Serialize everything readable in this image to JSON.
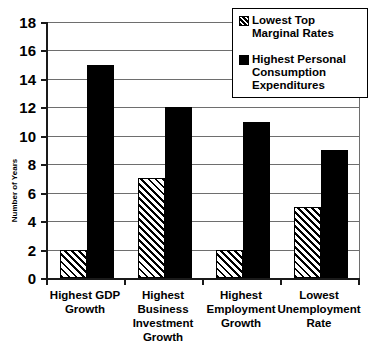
{
  "chart_data": {
    "type": "bar",
    "title": "",
    "xlabel": "",
    "ylabel": "Number of Years",
    "ylim": [
      0,
      18
    ],
    "ytick_step": 2,
    "yticks": [
      18,
      16,
      14,
      12,
      10,
      8,
      6,
      4,
      2,
      0
    ],
    "grid": true,
    "legend_position": "top-right",
    "categories": [
      "Highest GDP\nGrowth",
      "Highest\nBusiness\nInvestment\nGrowth",
      "Highest\nEmployment\nGrowth",
      "Lowest\nUnemployment\nRate"
    ],
    "series": [
      {
        "name": "Lowest Top\nMarginal Rates",
        "style": "hatched-diagonal",
        "color": "#ffffff",
        "values": [
          2,
          7,
          2,
          5
        ]
      },
      {
        "name": "Highest Personal\nConsumption\nExpenditures",
        "style": "solid",
        "color": "#000000",
        "values": [
          15,
          12,
          11,
          9
        ]
      }
    ]
  },
  "axis": {
    "line_color": "#1a1a1a",
    "grid_color": "#6e6e6e"
  }
}
